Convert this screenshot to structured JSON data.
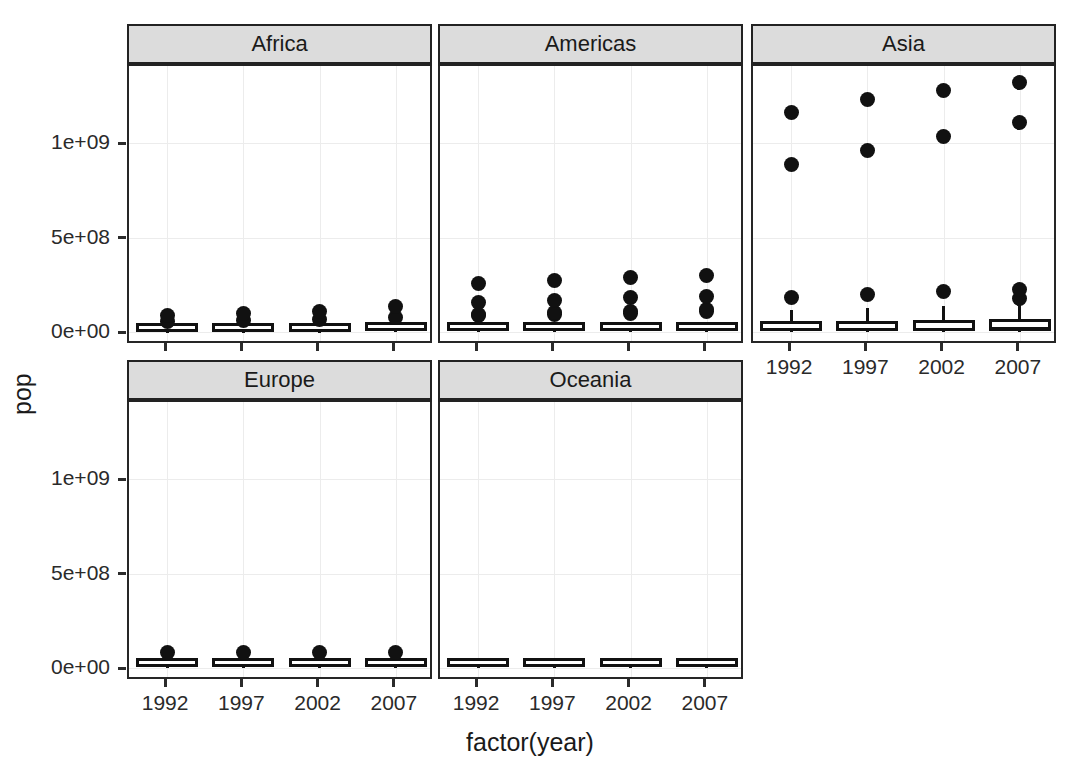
{
  "chart_data": {
    "type": "box",
    "title": "",
    "xlabel": "factor(year)",
    "ylabel": "pop",
    "facet_variable": "continent",
    "facet_layout": "wrap, 3 columns x 2 rows",
    "categories": [
      "1992",
      "1997",
      "2002",
      "2007"
    ],
    "ylim": [
      0,
      1400000000
    ],
    "yticks": [
      {
        "label": "0e+00",
        "value": 0
      },
      {
        "label": "5e+08",
        "value": 500000000
      },
      {
        "label": "1e+09",
        "value": 1000000000
      }
    ],
    "xticks": [
      "1992",
      "1997",
      "2002",
      "2007"
    ],
    "grid": "major gridlines only, light gray",
    "legend": "none",
    "panels": [
      {
        "name": "Africa",
        "row": 0,
        "col": 0,
        "boxes": [
          {
            "x": "1992",
            "min": 0,
            "q1": 2000000,
            "median": 8500000,
            "q3": 18000000,
            "max": 38000000,
            "outliers": [
              56000000,
              88000000
            ]
          },
          {
            "x": "1997",
            "min": 0,
            "q1": 2200000,
            "median": 9200000,
            "q3": 19500000,
            "max": 41000000,
            "outliers": [
              60000000,
              98000000
            ]
          },
          {
            "x": "2002",
            "min": 0,
            "q1": 2400000,
            "median": 10000000,
            "q3": 21000000,
            "max": 45000000,
            "outliers": [
              67000000,
              110000000
            ]
          },
          {
            "x": "2007",
            "min": 0,
            "q1": 2700000,
            "median": 10900000,
            "q3": 22500000,
            "max": 49000000,
            "outliers": [
              76000000,
              135000000
            ]
          }
        ]
      },
      {
        "name": "Americas",
        "row": 0,
        "col": 1,
        "boxes": [
          {
            "x": "1992",
            "min": 0,
            "q1": 3500000,
            "median": 7800000,
            "q3": 24000000,
            "max": 45000000,
            "outliers": [
              85000000,
              95000000,
              154000000,
              256000000
            ]
          },
          {
            "x": "1997",
            "min": 0,
            "q1": 3800000,
            "median": 8400000,
            "q3": 25500000,
            "max": 48000000,
            "outliers": [
              92000000,
              102000000,
              168000000,
              272000000
            ]
          },
          {
            "x": "2002",
            "min": 0,
            "q1": 4000000,
            "median": 9000000,
            "q3": 27000000,
            "max": 51000000,
            "outliers": [
              99000000,
              110000000,
              180000000,
              288000000
            ]
          },
          {
            "x": "2007",
            "min": 0,
            "q1": 4200000,
            "median": 9600000,
            "q3": 28500000,
            "max": 54000000,
            "outliers": [
              106000000,
              120000000,
              190000000,
              301000000
            ]
          }
        ]
      },
      {
        "name": "Asia",
        "row": 0,
        "col": 2,
        "boxes": [
          {
            "x": "1992",
            "min": 300000,
            "q1": 5500000,
            "median": 19000000,
            "q3": 56000000,
            "max": 115000000,
            "outliers": [
              185000000,
              884000000,
              1164000000
            ]
          },
          {
            "x": "1997",
            "min": 350000,
            "q1": 6000000,
            "median": 20500000,
            "q3": 60000000,
            "max": 125000000,
            "outliers": [
              200000000,
              960000000,
              1230000000
            ]
          },
          {
            "x": "2002",
            "min": 400000,
            "q1": 6500000,
            "median": 22000000,
            "q3": 64000000,
            "max": 135000000,
            "outliers": [
              212000000,
              1034000000,
              1280000000
            ]
          },
          {
            "x": "2007",
            "min": 450000,
            "q1": 7000000,
            "median": 24000000,
            "q3": 69000000,
            "max": 145000000,
            "outliers": [
              177000000,
              224000000,
              1110000000,
              1318000000
            ]
          }
        ]
      },
      {
        "name": "Europe",
        "row": 1,
        "col": 0,
        "boxes": [
          {
            "x": "1992",
            "min": 300000,
            "q1": 4200000,
            "median": 8700000,
            "q3": 20000000,
            "max": 40000000,
            "outliers": [
              80000000
            ]
          },
          {
            "x": "1997",
            "min": 320000,
            "q1": 4300000,
            "median": 8900000,
            "q3": 21000000,
            "max": 41000000,
            "outliers": [
              82000000
            ]
          },
          {
            "x": "2002",
            "min": 330000,
            "q1": 4400000,
            "median": 9100000,
            "q3": 22000000,
            "max": 42000000,
            "outliers": [
              82300000
            ]
          },
          {
            "x": "2007",
            "min": 340000,
            "q1": 4500000,
            "median": 9300000,
            "q3": 22500000,
            "max": 44000000,
            "outliers": [
              82400000
            ]
          }
        ]
      },
      {
        "name": "Oceania",
        "row": 1,
        "col": 1,
        "boxes": [
          {
            "x": "1992",
            "min": 3400000,
            "q1": 4200000,
            "median": 10000000,
            "q3": 14000000,
            "max": 17500000,
            "outliers": []
          },
          {
            "x": "1997",
            "min": 3600000,
            "q1": 4400000,
            "median": 10400000,
            "q3": 14800000,
            "max": 18500000,
            "outliers": []
          },
          {
            "x": "2002",
            "min": 3800000,
            "q1": 4700000,
            "median": 11000000,
            "q3": 15500000,
            "max": 19500000,
            "outliers": []
          },
          {
            "x": "2007",
            "min": 4100000,
            "q1": 5000000,
            "median": 11500000,
            "q3": 16400000,
            "max": 20400000,
            "outliers": []
          }
        ]
      }
    ]
  },
  "axes": {
    "y_title": "pop",
    "x_title": "factor(year)"
  },
  "colors": {
    "panel_background": "#ffffff",
    "strip_background": "#dcdcdc",
    "panel_border": "#262626",
    "grid": "#ececec",
    "ink": "#111111"
  }
}
